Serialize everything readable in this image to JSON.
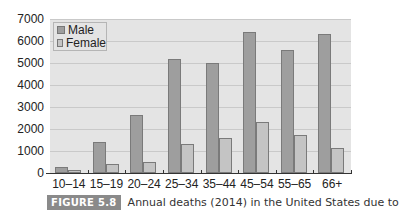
{
  "chart_data": {
    "type": "bar",
    "title": "",
    "xlabel": "",
    "ylabel": "",
    "categories": [
      "10–14",
      "15–19",
      "20–24",
      "25–34",
      "35–44",
      "45–54",
      "55–65",
      "66+"
    ],
    "series": [
      {
        "name": "Male",
        "values": [
          270,
          1400,
          2650,
          5200,
          5000,
          6400,
          5600,
          6300
        ],
        "color": "#9e9e9e"
      },
      {
        "name": "Female",
        "values": [
          130,
          400,
          520,
          1300,
          1600,
          2300,
          1750,
          1150
        ],
        "color": "#c4c4c4"
      }
    ],
    "ylim": [
      0,
      7000
    ],
    "yticks": [
      "0",
      "1000",
      "2000",
      "3000",
      "4000",
      "5000",
      "6000",
      "7000"
    ],
    "grid": true,
    "legend_position": "top-left"
  },
  "legend": {
    "male": "Male",
    "female": "Female"
  },
  "caption": {
    "tag": "FIGURE 5.8",
    "text": "Annual deaths (2014) in the United States due to"
  }
}
